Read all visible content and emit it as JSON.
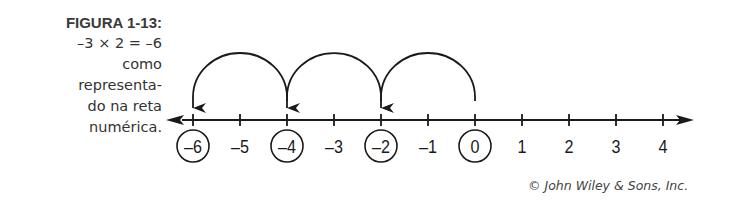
{
  "caption": {
    "label": "FIGURA 1-13:",
    "lines": [
      "–3 × 2 = –6",
      "como",
      "representa-",
      "do na reta",
      "numérica."
    ]
  },
  "credit": "© John Wiley & Sons, Inc.",
  "number_line": {
    "ticks": [
      {
        "value": -6,
        "label": "–6",
        "circled": true
      },
      {
        "value": -5,
        "label": "–5",
        "circled": false
      },
      {
        "value": -4,
        "label": "–4",
        "circled": true
      },
      {
        "value": -3,
        "label": "–3",
        "circled": false
      },
      {
        "value": -2,
        "label": "–2",
        "circled": true
      },
      {
        "value": -1,
        "label": "–1",
        "circled": false
      },
      {
        "value": 0,
        "label": "0",
        "circled": true
      },
      {
        "value": 1,
        "label": "1",
        "circled": false
      },
      {
        "value": 2,
        "label": "2",
        "circled": false
      },
      {
        "value": 3,
        "label": "3",
        "circled": false
      },
      {
        "value": 4,
        "label": "4",
        "circled": false
      }
    ],
    "jumps": [
      {
        "from": 0,
        "to": -2
      },
      {
        "from": -2,
        "to": -4
      },
      {
        "from": -4,
        "to": -6
      }
    ],
    "line_color": "#1a1a1a"
  }
}
